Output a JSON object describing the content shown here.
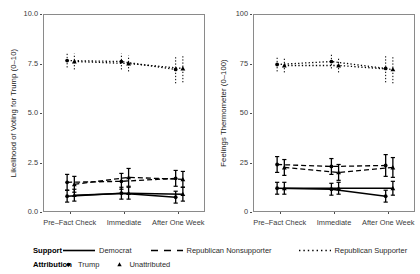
{
  "chart_data": {
    "type": "line",
    "title": "",
    "panels": [
      {
        "name": "likelihood-voting",
        "ylabel": "Likelihood of Voting for Trump (0–10)",
        "xlabel": "",
        "ylim": [
          0,
          10
        ],
        "yticks": [
          0.0,
          2.5,
          5.0,
          7.5,
          10.0
        ],
        "yticklabels": [
          "0.0",
          "2.5",
          "5.0",
          "7.5",
          "10.0"
        ],
        "categories": [
          "Pre–Fact Check",
          "Immediate",
          "After One Week"
        ],
        "series": [
          {
            "name": "Democrat",
            "support": "Democrat",
            "linestyle": "solid",
            "attributions": [
              {
                "name": "Trump",
                "marker": "circle",
                "values": [
                  0.85,
                  1.0,
                  0.8
                ],
                "ci_low": [
                  0.55,
                  0.7,
                  0.5
                ],
                "ci_high": [
                  1.15,
                  1.3,
                  1.1
                ]
              },
              {
                "name": "Unattributed",
                "marker": "triangle",
                "values": [
                  0.9,
                  1.0,
                  0.95
                ],
                "ci_low": [
                  0.6,
                  0.7,
                  0.6
                ],
                "ci_high": [
                  1.2,
                  1.3,
                  1.3
                ]
              }
            ]
          },
          {
            "name": "Republican Nonsupporter",
            "support": "Republican Nonsupporter",
            "linestyle": "dashed",
            "attributions": [
              {
                "name": "Trump",
                "marker": "circle",
                "values": [
                  1.55,
                  1.6,
                  1.75
                ],
                "ci_low": [
                  1.15,
                  1.2,
                  1.35
                ],
                "ci_high": [
                  1.95,
                  2.0,
                  2.15
                ]
              },
              {
                "name": "Unattributed",
                "marker": "triangle",
                "values": [
                  1.45,
                  1.8,
                  1.7
                ],
                "ci_low": [
                  1.05,
                  1.35,
                  1.3
                ],
                "ci_high": [
                  1.85,
                  2.25,
                  2.1
                ]
              }
            ]
          },
          {
            "name": "Republican Supporter",
            "support": "Republican Supporter",
            "linestyle": "dotted",
            "attributions": [
              {
                "name": "Trump",
                "marker": "circle",
                "values": [
                  7.7,
                  7.65,
                  7.25
                ],
                "ci_low": [
                  7.35,
                  7.25,
                  6.55
                ],
                "ci_high": [
                  8.05,
                  8.05,
                  7.95
                ]
              },
              {
                "name": "Unattributed",
                "marker": "triangle",
                "values": [
                  7.65,
                  7.55,
                  7.3
                ],
                "ci_low": [
                  7.25,
                  7.15,
                  6.6
                ],
                "ci_high": [
                  8.05,
                  7.95,
                  8.0
                ]
              }
            ]
          }
        ]
      },
      {
        "name": "feelings-thermometer",
        "ylabel": "Feelings Thermometer (0–100)",
        "xlabel": "",
        "ylim": [
          0,
          100
        ],
        "yticks": [
          0,
          25,
          50,
          75,
          100
        ],
        "yticklabels": [
          "0",
          "25",
          "50",
          "75",
          "100"
        ],
        "categories": [
          "Pre–Fact Check",
          "Immediate",
          "After One Week"
        ],
        "series": [
          {
            "name": "Democrat",
            "support": "Democrat",
            "linestyle": "solid",
            "attributions": [
              {
                "name": "Trump",
                "marker": "circle",
                "values": [
                  12.5,
                  12.0,
                  8.5
                ],
                "ci_low": [
                  9.5,
                  9.0,
                  5.5
                ],
                "ci_high": [
                  15.5,
                  15.0,
                  11.5
                ]
              },
              {
                "name": "Unattributed",
                "marker": "triangle",
                "values": [
                  12.5,
                  12.5,
                  12.5
                ],
                "ci_low": [
                  9.5,
                  9.5,
                  9.0
                ],
                "ci_high": [
                  15.5,
                  15.5,
                  16.0
                ]
              }
            ]
          },
          {
            "name": "Republican Nonsupporter",
            "support": "Republican Nonsupporter",
            "linestyle": "dashed",
            "attributions": [
              {
                "name": "Trump",
                "marker": "circle",
                "values": [
                  24.5,
                  23.5,
                  24.0
                ],
                "ci_low": [
                  20.5,
                  19.5,
                  18.5
                ],
                "ci_high": [
                  28.5,
                  27.5,
                  29.5
                ]
              },
              {
                "name": "Unattributed",
                "marker": "triangle",
                "values": [
                  23.0,
                  20.5,
                  23.0
                ],
                "ci_low": [
                  19.0,
                  16.5,
                  18.0
                ],
                "ci_high": [
                  27.0,
                  24.5,
                  28.0
                ]
              }
            ]
          },
          {
            "name": "Republican Supporter",
            "support": "Republican Supporter",
            "linestyle": "dotted",
            "attributions": [
              {
                "name": "Trump",
                "marker": "circle",
                "values": [
                  75.0,
                  76.5,
                  73.0
                ],
                "ci_low": [
                  71.5,
                  73.0,
                  66.0
                ],
                "ci_high": [
                  78.5,
                  80.0,
                  80.0
                ]
              },
              {
                "name": "Unattributed",
                "marker": "triangle",
                "values": [
                  74.5,
                  74.5,
                  72.5
                ],
                "ci_low": [
                  71.0,
                  71.0,
                  65.5
                ],
                "ci_high": [
                  78.0,
                  78.0,
                  79.5
                ]
              }
            ]
          }
        ]
      }
    ],
    "legend": {
      "position": "bottom",
      "rows": [
        {
          "title": "Support",
          "items": [
            {
              "label": "Democrat",
              "key": "solid-line"
            },
            {
              "label": "Republican Nonsupporter",
              "key": "dashed-line"
            },
            {
              "label": "Republican Supporter",
              "key": "dotted-line"
            }
          ]
        },
        {
          "title": "Attribution",
          "items": [
            {
              "label": "Trump",
              "key": "circle-marker"
            },
            {
              "label": "Unattributed",
              "key": "triangle-marker"
            }
          ]
        }
      ]
    },
    "colors": {
      "ink": "#000000",
      "axis": "#8a8a8a",
      "tick_text": "#3a3a3a",
      "background": "#ffffff"
    },
    "grid": false
  }
}
